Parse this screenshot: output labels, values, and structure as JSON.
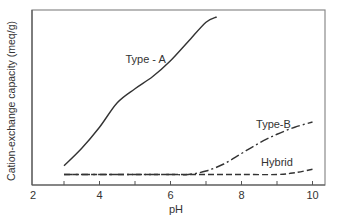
{
  "chart_data": {
    "type": "line",
    "title": "",
    "xlabel": "pH",
    "ylabel": "Cation-exchange capacity (meq/g)",
    "xlim": [
      2,
      10.3
    ],
    "ylim": [
      0,
      1
    ],
    "x_ticks": [
      2,
      3,
      4,
      5,
      6,
      7,
      8,
      9,
      10
    ],
    "x_tick_labels": [
      "2",
      "4",
      "6",
      "8",
      "10"
    ],
    "y_ticks": [],
    "grid": false,
    "legend": "inline labels",
    "series": [
      {
        "name": "Type - A",
        "style": "solid",
        "x": [
          3.0,
          3.5,
          4.0,
          4.5,
          5.0,
          5.5,
          6.0,
          6.5,
          7.0,
          7.3
        ],
        "y": [
          0.11,
          0.21,
          0.33,
          0.47,
          0.55,
          0.62,
          0.71,
          0.82,
          0.93,
          0.96
        ]
      },
      {
        "name": "Type-B",
        "style": "dash-dot",
        "x": [
          3.0,
          4.0,
          5.0,
          6.0,
          6.5,
          7.0,
          7.5,
          8.0,
          8.5,
          9.0,
          9.5,
          10.0
        ],
        "y": [
          0.06,
          0.06,
          0.06,
          0.06,
          0.06,
          0.08,
          0.12,
          0.18,
          0.24,
          0.29,
          0.33,
          0.36
        ]
      },
      {
        "name": "Hybrid",
        "style": "dashed",
        "x": [
          3.0,
          4.0,
          5.0,
          6.0,
          7.0,
          8.0,
          9.0,
          9.5,
          10.0
        ],
        "y": [
          0.06,
          0.06,
          0.06,
          0.06,
          0.06,
          0.06,
          0.06,
          0.07,
          0.09
        ]
      }
    ],
    "annotations": [
      {
        "text": "Type - A",
        "x": 5.3,
        "y": 0.72
      },
      {
        "text": "Type-B",
        "x": 8.9,
        "y": 0.35
      },
      {
        "text": "Hybrid",
        "x": 9.0,
        "y": 0.13
      }
    ]
  }
}
